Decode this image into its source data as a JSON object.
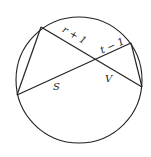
{
  "diagram": {
    "type": "intersecting-chords-in-circle",
    "circle": {
      "cx": 79,
      "cy": 80,
      "r": 63
    },
    "points": {
      "A": [
        41,
        27
      ],
      "B": [
        17,
        95
      ],
      "C": [
        131,
        43
      ],
      "D": [
        142,
        87
      ]
    },
    "segments": [
      {
        "from": "A",
        "to": "D",
        "note": "chord"
      },
      {
        "from": "B",
        "to": "C",
        "note": "chord"
      },
      {
        "from": "A",
        "to": "B",
        "note": "triangle side"
      },
      {
        "from": "C",
        "to": "D",
        "note": "triangle side"
      }
    ],
    "labels": {
      "r_plus_1": "r + 1",
      "t_minus_1": "t − 1",
      "s": "S",
      "v": "V"
    },
    "colors": {
      "stroke": "#222222",
      "background": "#ffffff"
    }
  }
}
